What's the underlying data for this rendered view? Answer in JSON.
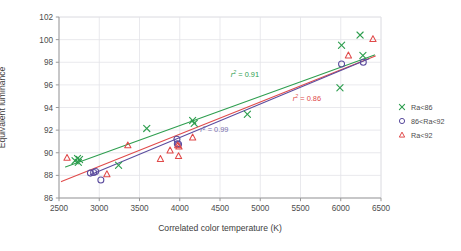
{
  "chart_data": {
    "type": "scatter",
    "title": "",
    "xlabel": "Correlated color temperature (K)",
    "ylabel_line1": "Equivalent luminance",
    "ylabel_line2": "(Ware-Cowan), L",
    "ylabel_sub": "eq",
    "ylabel_line3": " (cd m",
    "ylabel_sup": "-2",
    "ylabel_close": ")",
    "xlim": [
      2500,
      6500
    ],
    "ylim": [
      86,
      102
    ],
    "xticks": [
      2500,
      3000,
      3500,
      4000,
      4500,
      5000,
      5500,
      6000,
      6500
    ],
    "yticks": [
      86,
      88,
      90,
      92,
      94,
      96,
      98,
      100,
      102
    ],
    "grid": true,
    "legend_position": "right-outside",
    "series": [
      {
        "name": "Ra<86",
        "marker": "x",
        "color": "#2e9e4f",
        "points": [
          [
            2700,
            89.3
          ],
          [
            2730,
            89.5
          ],
          [
            2755,
            89.4
          ],
          [
            2740,
            89.15
          ],
          [
            3240,
            88.9
          ],
          [
            3590,
            92.15
          ],
          [
            4160,
            92.85
          ],
          [
            4180,
            92.6
          ],
          [
            4840,
            93.4
          ],
          [
            5990,
            95.75
          ],
          [
            6010,
            99.5
          ],
          [
            6240,
            100.4
          ],
          [
            6275,
            98.6
          ]
        ]
      },
      {
        "name": "86<Ra<92",
        "marker": "o",
        "color": "#5b4c9e",
        "points": [
          [
            2890,
            88.2
          ],
          [
            2930,
            88.25
          ],
          [
            2955,
            88.35
          ],
          [
            3020,
            87.6
          ],
          [
            3970,
            90.8
          ],
          [
            3985,
            90.75
          ],
          [
            3965,
            91.2
          ],
          [
            6010,
            97.85
          ],
          [
            6280,
            98.0
          ]
        ]
      },
      {
        "name": "Ra<92",
        "marker": "triangle",
        "color": "#e04a4a",
        "points": [
          [
            2600,
            89.55
          ],
          [
            3095,
            88.1
          ],
          [
            3355,
            90.65
          ],
          [
            3760,
            89.45
          ],
          [
            3880,
            90.2
          ],
          [
            3985,
            89.7
          ],
          [
            3975,
            90.65
          ],
          [
            3990,
            90.55
          ],
          [
            4160,
            91.35
          ],
          [
            6095,
            98.6
          ],
          [
            6400,
            100.05
          ]
        ]
      }
    ],
    "fit_lines": [
      {
        "name": "Ra<86 fit",
        "color": "#2e9e4f",
        "x0": 2580,
        "y0": 88.75,
        "x1": 6420,
        "y1": 98.65,
        "r2_label": "r  = 0.91",
        "r2_value": 0.91
      },
      {
        "name": "Ra<92 fit",
        "color": "#e04a4a",
        "x0": 2530,
        "y0": 87.45,
        "x1": 6430,
        "y1": 98.55,
        "r2_label": "r  = 0.86",
        "r2_value": 0.86
      },
      {
        "name": "86<Ra<92 fit",
        "color": "#5b4c9e",
        "x0": 2890,
        "y0": 88.05,
        "x1": 6350,
        "y1": 98.3,
        "r2_label": "r  = 0.99",
        "r2_value": 0.99
      }
    ],
    "annotations": [
      {
        "text": "r",
        "sup": "2",
        "rest": " = 0.91",
        "color": "#2e9e4f",
        "x": 4810,
        "y": 96.7
      },
      {
        "text": "r",
        "sup": "2",
        "rest": " = 0.86",
        "color": "#e04a4a",
        "x": 5580,
        "y": 94.6
      },
      {
        "text": "r",
        "sup": "2",
        "rest": " = 0.99",
        "color": "#7a6fae",
        "x": 4430,
        "y": 91.8
      }
    ],
    "legend": [
      {
        "label": "Ra<86",
        "marker": "x",
        "color": "#2e9e4f"
      },
      {
        "label": "86<Ra<92",
        "marker": "o",
        "color": "#5b4c9e"
      },
      {
        "label": "Ra<92",
        "marker": "triangle",
        "color": "#e04a4a"
      }
    ],
    "colors": {
      "green": "#2e9e4f",
      "purple": "#5b4c9e",
      "red": "#e04a4a",
      "grid": "#e3e3e8",
      "axis": "#9a9a9a",
      "text": "#4d4d4d",
      "background": "#ffffff"
    }
  }
}
